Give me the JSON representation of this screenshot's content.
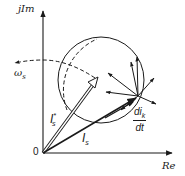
{
  "diagram": {
    "type": "phasor-diagram",
    "axes": {
      "vertical_label": "jIm",
      "horizontal_label": "Re",
      "origin_label": "0"
    },
    "labels": {
      "omega": "ω",
      "omega_sub": "s",
      "is_star": "I",
      "is_star_sub": "s",
      "is_star_sup": "*",
      "is": "I",
      "is_sub": "s",
      "dik_num": "di",
      "dik_num_sub": "k",
      "dik_den": "dt"
    },
    "colors": {
      "stroke": "#1a1a1a",
      "background": "#ffffff"
    }
  }
}
